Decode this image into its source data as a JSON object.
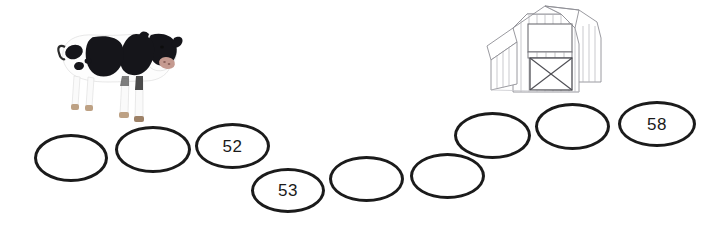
{
  "page": {
    "background_color": "#ffffff",
    "width": 719,
    "height": 229
  },
  "illustrations": [
    {
      "name": "cow-image",
      "label": "Cow",
      "x": 50,
      "y": 14,
      "width": 132,
      "height": 116,
      "colors": {
        "body": "#ffffff",
        "patches": "#1a1a1a",
        "muzzle": "#caa69b",
        "hooves": "#c2a183"
      }
    },
    {
      "name": "barn-image",
      "label": "Barn",
      "x": 483,
      "y": 4,
      "width": 126,
      "height": 96,
      "colors": {
        "fill": "#ffffff",
        "outline": "#8d8d92",
        "door_outline": "#4f4f55"
      }
    }
  ],
  "path": {
    "stroke_color": "#1b1b1b",
    "stroke_width": 3,
    "ovals": [
      {
        "name": "oval-1",
        "value": "",
        "filled": false,
        "x": 34,
        "y": 134,
        "width": 74,
        "height": 48
      },
      {
        "name": "oval-2",
        "value": "",
        "filled": false,
        "x": 115,
        "y": 126,
        "width": 76,
        "height": 47
      },
      {
        "name": "oval-3",
        "value": "52",
        "filled": true,
        "x": 195,
        "y": 123,
        "width": 75,
        "height": 46
      },
      {
        "name": "oval-4",
        "value": "53",
        "filled": true,
        "x": 251,
        "y": 168,
        "width": 74,
        "height": 45
      },
      {
        "name": "oval-5",
        "value": "",
        "filled": false,
        "x": 329,
        "y": 156,
        "width": 75,
        "height": 46
      },
      {
        "name": "oval-6",
        "value": "",
        "filled": false,
        "x": 410,
        "y": 153,
        "width": 75,
        "height": 46
      },
      {
        "name": "oval-7",
        "value": "",
        "filled": false,
        "x": 454,
        "y": 112,
        "width": 77,
        "height": 47
      },
      {
        "name": "oval-8",
        "value": "",
        "filled": false,
        "x": 535,
        "y": 103,
        "width": 75,
        "height": 47
      },
      {
        "name": "oval-9",
        "value": "58",
        "filled": true,
        "x": 618,
        "y": 101,
        "width": 78,
        "height": 46
      }
    ]
  }
}
